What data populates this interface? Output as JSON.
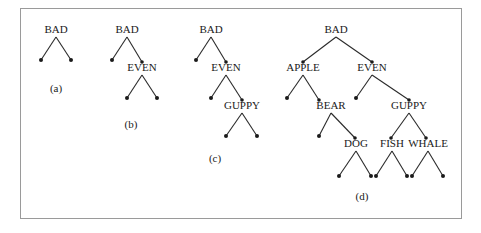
{
  "figure": {
    "panels": [
      {
        "id": "a",
        "caption": "(a)",
        "nodes": [
          {
            "key": "BAD",
            "x": 56,
            "y": 33
          }
        ],
        "edges": [],
        "leaves": [
          [
            56,
            33,
            41,
            60
          ],
          [
            56,
            33,
            71,
            60
          ]
        ],
        "caption_pos": [
          56,
          92
        ]
      },
      {
        "id": "b",
        "caption": "(b)",
        "nodes": [
          {
            "key": "BAD",
            "x": 127,
            "y": 33
          },
          {
            "key": "EVEN",
            "x": 142,
            "y": 71
          }
        ],
        "edges": [
          [
            127,
            33,
            142,
            62
          ]
        ],
        "leaves": [
          [
            127,
            33,
            112,
            60
          ],
          [
            142,
            71,
            127,
            98
          ],
          [
            142,
            71,
            157,
            98
          ]
        ],
        "caption_pos": [
          131,
          128
        ]
      },
      {
        "id": "c",
        "caption": "(c)",
        "nodes": [
          {
            "key": "BAD",
            "x": 211,
            "y": 33
          },
          {
            "key": "EVEN",
            "x": 226,
            "y": 71
          },
          {
            "key": "GUPPY",
            "x": 242,
            "y": 109
          }
        ],
        "edges": [
          [
            211,
            33,
            226,
            62
          ],
          [
            226,
            71,
            242,
            100
          ]
        ],
        "leaves": [
          [
            211,
            33,
            196,
            60
          ],
          [
            226,
            71,
            211,
            98
          ],
          [
            242,
            109,
            226,
            136
          ],
          [
            242,
            109,
            257,
            136
          ]
        ],
        "caption_pos": [
          215,
          162
        ]
      },
      {
        "id": "d",
        "caption": "(d)",
        "nodes": [
          {
            "key": "BAD",
            "x": 336,
            "y": 33
          },
          {
            "key": "APPLE",
            "x": 303,
            "y": 71
          },
          {
            "key": "EVEN",
            "x": 372,
            "y": 71
          },
          {
            "key": "BEAR",
            "x": 331,
            "y": 109
          },
          {
            "key": "GUPPY",
            "x": 409,
            "y": 109
          },
          {
            "key": "DOG",
            "x": 356,
            "y": 147
          },
          {
            "key": "FISH",
            "x": 392,
            "y": 147
          },
          {
            "key": "WHALE",
            "x": 428,
            "y": 147
          }
        ],
        "edges": [
          [
            336,
            33,
            303,
            62
          ],
          [
            336,
            33,
            372,
            62
          ],
          [
            303,
            71,
            319,
            100
          ],
          [
            372,
            71,
            409,
            100
          ],
          [
            331,
            109,
            355,
            138
          ],
          [
            409,
            109,
            391,
            138
          ],
          [
            409,
            109,
            426,
            138
          ]
        ],
        "leaves": [
          [
            303,
            71,
            287,
            98
          ],
          [
            372,
            71,
            356,
            98
          ],
          [
            331,
            109,
            319,
            136
          ],
          [
            356,
            147,
            339,
            176
          ],
          [
            356,
            147,
            371,
            176
          ],
          [
            392,
            147,
            376,
            176
          ],
          [
            392,
            147,
            407,
            176
          ],
          [
            428,
            147,
            412,
            176
          ],
          [
            428,
            147,
            443,
            176
          ]
        ],
        "caption_pos": [
          362,
          200
        ]
      }
    ]
  }
}
